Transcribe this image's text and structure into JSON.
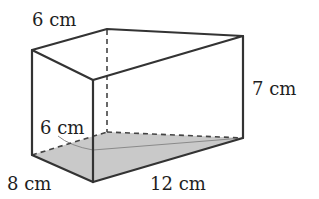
{
  "figure": {
    "type": "triangular prism (right-angled triangle base)",
    "colors": {
      "edge": "#333333",
      "base_fill": "#c8c8c8",
      "text": "#1e1e1e",
      "background": "#ffffff"
    },
    "labels": {
      "top_back_edge": "6 cm",
      "height": "7 cm",
      "base_hypotenuse_side": "6 cm",
      "base_short_side": "8 cm",
      "base_long_side": "12 cm"
    }
  }
}
